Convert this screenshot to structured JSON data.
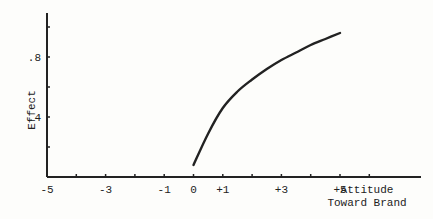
{
  "chart_data": {
    "type": "line",
    "title": "",
    "xlabel": "Attitude Toward Brand",
    "xlabel_lines": [
      "Attitude",
      "Toward Brand"
    ],
    "ylabel": "Effect",
    "xlim": [
      -5,
      7
    ],
    "ylim": [
      0,
      1.0
    ],
    "x_ticks": [
      -5,
      -4,
      -3,
      -2,
      -1,
      0,
      1,
      2,
      3,
      4,
      5,
      6
    ],
    "x_tick_labels": [
      {
        "value": -5,
        "label": "-5"
      },
      {
        "value": -3,
        "label": "-3"
      },
      {
        "value": -1,
        "label": "-1"
      },
      {
        "value": 0,
        "label": "0"
      },
      {
        "value": 1,
        "label": "+1"
      },
      {
        "value": 3,
        "label": "+3"
      },
      {
        "value": 5,
        "label": "+5"
      }
    ],
    "y_ticks": [
      0.2,
      0.4,
      0.6,
      0.8,
      1.0
    ],
    "y_tick_labels": [
      {
        "value": 0.4,
        "label": ".4"
      },
      {
        "value": 0.8,
        "label": ".8"
      }
    ],
    "grid": false,
    "legend": null,
    "series": [
      {
        "name": "Effect",
        "x": [
          0,
          0.5,
          1,
          1.5,
          2,
          2.5,
          3,
          3.5,
          4,
          4.5,
          5
        ],
        "y": [
          0.08,
          0.29,
          0.46,
          0.57,
          0.65,
          0.72,
          0.78,
          0.83,
          0.88,
          0.92,
          0.96
        ]
      }
    ],
    "colors": {
      "line": "#222222",
      "axis": "#222222",
      "background": "#fdfdfb"
    }
  }
}
